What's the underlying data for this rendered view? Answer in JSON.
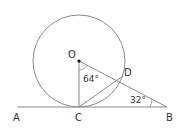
{
  "diagram": {
    "points": {
      "O": {
        "label": "O",
        "x": 79,
        "y": 61
      },
      "C": {
        "label": "C",
        "x": 79,
        "y": 107
      },
      "D": {
        "label": "D",
        "x": 123,
        "y": 76
      },
      "B": {
        "label": "B",
        "x": 167,
        "y": 107
      },
      "A": {
        "label": "A",
        "x": 17,
        "y": 107
      }
    },
    "circle": {
      "center": "O",
      "radius": 46
    },
    "angles": {
      "COD": {
        "label": "64°",
        "value": 64
      },
      "DBC": {
        "label": "32°",
        "value": 32
      }
    },
    "segments": [
      "AB",
      "OC",
      "OD",
      "OB",
      "CD"
    ],
    "colors": {
      "stroke": "#888888",
      "text": "#333333",
      "point": "#000000"
    }
  }
}
